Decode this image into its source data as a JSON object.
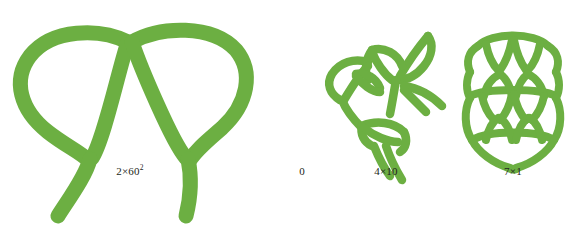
{
  "figure": {
    "background_color": "#ffffff",
    "stroke_color": "#6CAF42",
    "stroke_color_shade": "#5f9f38",
    "panels": [
      {
        "name": "panel-stage-1",
        "label": "2×60",
        "label_exponent": "2",
        "label_full": "2×60²",
        "center_x": 130,
        "scale": "large"
      },
      {
        "name": "panel-stage-2",
        "label": "0",
        "label_exponent": "",
        "label_full": "0",
        "center_x": 302,
        "scale": "none"
      },
      {
        "name": "panel-stage-3",
        "label": "4×10",
        "label_exponent": "",
        "label_full": "4×10",
        "center_x": 386,
        "scale": "medium"
      },
      {
        "name": "panel-stage-4",
        "label": "7×1",
        "label_exponent": "",
        "label_full": "7×1",
        "center_x": 513,
        "scale": "small"
      }
    ]
  },
  "canvas": {
    "width": 580,
    "height": 245
  }
}
